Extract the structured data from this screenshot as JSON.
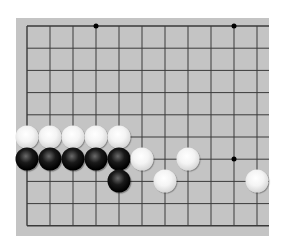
{
  "board": {
    "background_color": "#c4c4c4",
    "line_color": "#3a3a3a",
    "columns_visible": 11,
    "rows_visible": 10,
    "edges_shown": [
      "top",
      "left",
      "bottom"
    ],
    "star_points": [
      {
        "col": 3,
        "row": 0
      },
      {
        "col": 9,
        "row": 0
      },
      {
        "col": 9,
        "row": 6
      }
    ],
    "stones": [
      {
        "color": "white",
        "col": 0,
        "row": 5
      },
      {
        "color": "white",
        "col": 1,
        "row": 5
      },
      {
        "color": "white",
        "col": 2,
        "row": 5
      },
      {
        "color": "white",
        "col": 3,
        "row": 5
      },
      {
        "color": "white",
        "col": 4,
        "row": 5
      },
      {
        "color": "black",
        "col": 0,
        "row": 6
      },
      {
        "color": "black",
        "col": 1,
        "row": 6
      },
      {
        "color": "black",
        "col": 2,
        "row": 6
      },
      {
        "color": "black",
        "col": 3,
        "row": 6
      },
      {
        "color": "black",
        "col": 4,
        "row": 6
      },
      {
        "color": "white",
        "col": 5,
        "row": 6
      },
      {
        "color": "white",
        "col": 7,
        "row": 6
      },
      {
        "color": "black",
        "col": 4,
        "row": 7
      },
      {
        "color": "white",
        "col": 6,
        "row": 7
      },
      {
        "color": "white",
        "col": 10,
        "row": 7
      }
    ]
  }
}
